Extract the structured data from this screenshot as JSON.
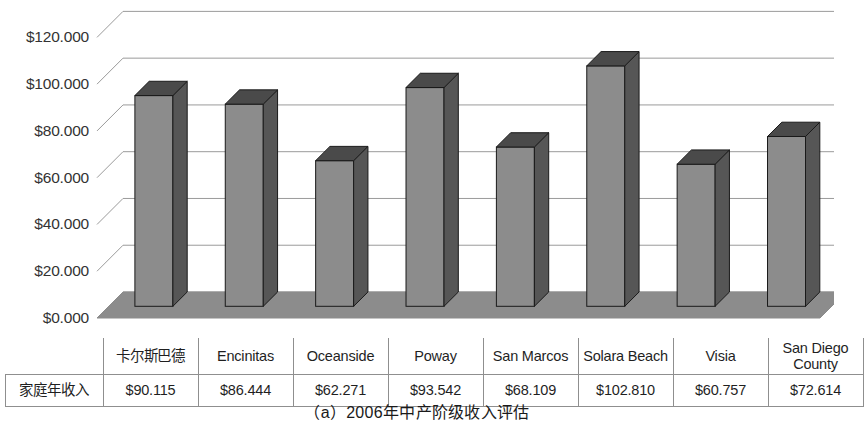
{
  "caption": "（a）2006年中产阶级收入评估",
  "axis": {
    "y_ticks": [
      "$0.000",
      "$20.000",
      "$40.000",
      "$60.000",
      "$80.000",
      "$100.000",
      "$120.000"
    ]
  },
  "table": {
    "corner_label": "",
    "row_label": "家庭年收入",
    "headers": [
      "卡尔斯巴德",
      "Encinitas",
      "Oceanside",
      "Poway",
      "San Marcos",
      "Solara Beach",
      "Visia",
      "San Diego County"
    ],
    "values": [
      "$90.115",
      "$86.444",
      "$62.271",
      "$93.542",
      "$68.109",
      "$102.810",
      "$60.757",
      "$72.614"
    ]
  },
  "colors": {
    "bar_front": "#8c8c8c",
    "bar_side": "#565656",
    "bar_top": "#4a4a4a",
    "bar_outline": "#1a1a1a",
    "floor": "#8c8c8c",
    "gridline": "#9a9a9a",
    "table_border": "#8f8f8f"
  },
  "chart_data": {
    "type": "bar",
    "title": "（a）2006年中产阶级收入评估",
    "xlabel": "",
    "ylabel": "",
    "ylim": [
      0,
      130
    ],
    "ytick_values": [
      0,
      20000,
      40000,
      60000,
      80000,
      100000,
      120000
    ],
    "ytick_labels": [
      "$0.000",
      "$20.000",
      "$40.000",
      "$60.000",
      "$80.000",
      "$100.000",
      "$120.000"
    ],
    "grid": true,
    "legend": false,
    "three_d": true,
    "series_name": "家庭年收入",
    "categories": [
      "卡尔斯巴德",
      "Encinitas",
      "Oceanside",
      "Poway",
      "San Marcos",
      "Solara Beach",
      "Visia",
      "San Diego County"
    ],
    "values": [
      90115,
      86444,
      62271,
      93542,
      68109,
      102810,
      60757,
      72614
    ],
    "value_labels": [
      "$90.115",
      "$86.444",
      "$62.271",
      "$93.542",
      "$68.109",
      "$102.810",
      "$60.757",
      "$72.614"
    ]
  }
}
